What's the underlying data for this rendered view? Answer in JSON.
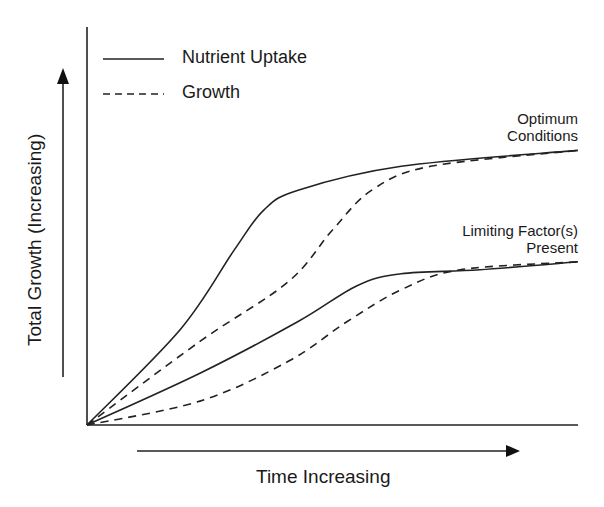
{
  "chart_data": {
    "type": "line",
    "title": "",
    "xlabel": "Time Increasing",
    "ylabel": "Total Growth (Increasing)",
    "xlim": [
      0,
      100
    ],
    "ylim": [
      0,
      100
    ],
    "grid": false,
    "ticks": "none (conceptual diagram)",
    "legend_position": "top-left",
    "legend": [
      {
        "label": "Nutrient Uptake",
        "style": "solid"
      },
      {
        "label": "Growth",
        "style": "dashed"
      }
    ],
    "annotations": [
      {
        "text": [
          "Optimum",
          "Conditions"
        ],
        "applies_to": "upper curve pair"
      },
      {
        "text": [
          "Limiting Factor(s)",
          "Present"
        ],
        "applies_to": "lower curve pair"
      }
    ],
    "series": [
      {
        "name": "Nutrient Uptake - Optimum Conditions",
        "style": "solid",
        "x": [
          0,
          19,
          30,
          36,
          43,
          64,
          100
        ],
        "y": [
          0,
          24,
          44,
          54,
          59,
          65,
          69
        ]
      },
      {
        "name": "Growth - Optimum Conditions",
        "style": "dashed",
        "x": [
          0,
          23,
          41,
          50,
          58,
          70,
          100
        ],
        "y": [
          0,
          21,
          36,
          49,
          59,
          65,
          69
        ]
      },
      {
        "name": "Nutrient Uptake - Limiting Factor(s) Present",
        "style": "solid",
        "x": [
          0,
          23,
          43,
          55,
          64,
          80,
          100
        ],
        "y": [
          0,
          13,
          26,
          35,
          38,
          39,
          41
        ]
      },
      {
        "name": "Growth - Limiting Factor(s) Present",
        "style": "dashed",
        "x": [
          0,
          23,
          41,
          53,
          64,
          76,
          100
        ],
        "y": [
          0,
          6,
          16,
          26,
          34,
          39,
          41
        ]
      }
    ]
  },
  "legend": {
    "items": [
      {
        "label": "Nutrient Uptake"
      },
      {
        "label": "Growth"
      }
    ]
  },
  "annotations": {
    "optimum": {
      "line1": "Optimum",
      "line2": "Conditions"
    },
    "limiting": {
      "line1": "Limiting Factor(s)",
      "line2": "Present"
    }
  },
  "axes": {
    "x_label": "Time Increasing",
    "y_label": "Total Growth (Increasing)"
  }
}
